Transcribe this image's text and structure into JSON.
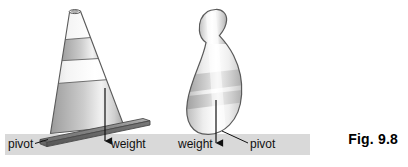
{
  "figure": {
    "caption": "Fig. 9.8",
    "ground_color": "#d9d9d9",
    "outline_color": "#4d4d4d",
    "arrow_color": "#1a1a1a",
    "objects": [
      {
        "name": "traffic-cone",
        "tilt": "leaning right",
        "base_plate_color": "#8c8c8c",
        "labels": {
          "pivot": "pivot",
          "weight": "weight"
        }
      },
      {
        "name": "bowling-pin",
        "tilt": "leaning right",
        "labels": {
          "weight": "weight",
          "pivot": "pivot"
        }
      }
    ],
    "labels": {
      "cone_pivot": "pivot",
      "cone_weight": "weight",
      "pin_weight": "weight",
      "pin_pivot": "pivot"
    }
  }
}
